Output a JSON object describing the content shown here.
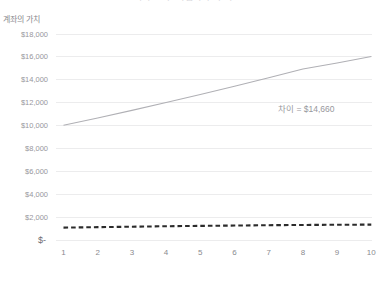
{
  "chart_data": {
    "type": "line",
    "title": "복리 효과: 적립식 투자 비교",
    "xlabel": "햇수",
    "ylabel": "계좌의 가치",
    "x": [
      1,
      2,
      3,
      4,
      5,
      6,
      7,
      8,
      9,
      10
    ],
    "xtick_labels": [
      "1",
      "2",
      "3",
      "4",
      "5",
      "6",
      "7",
      "8",
      "9",
      "10"
    ],
    "ylim": [
      0,
      18000
    ],
    "ytick_values": [
      0,
      2000,
      4000,
      6000,
      8000,
      10000,
      12000,
      14000,
      16000,
      18000
    ],
    "ytick_labels": [
      "$-",
      "$2,000",
      "$4,000",
      "$6,000",
      "$8,000",
      "$10,000",
      "$12,000",
      "$14,000",
      "$16,000",
      "$18,000"
    ],
    "grid": true,
    "legend": "none",
    "series": [
      {
        "name": "투자 계좌",
        "style": "solid",
        "color": "#b0b0b5",
        "values": [
          10000,
          10640,
          11300,
          11980,
          12680,
          13400,
          14140,
          14900,
          15420,
          16000
        ]
      },
      {
        "name": "저축 계좌",
        "style": "dashed",
        "color": "#2b2b2b",
        "values": [
          1080,
          1120,
          1160,
          1200,
          1230,
          1260,
          1290,
          1310,
          1330,
          1340
        ]
      }
    ],
    "annotations": [
      {
        "name": "difference-label",
        "text": "차이 = $14,660",
        "x": 8.1,
        "y": 11600
      }
    ]
  }
}
